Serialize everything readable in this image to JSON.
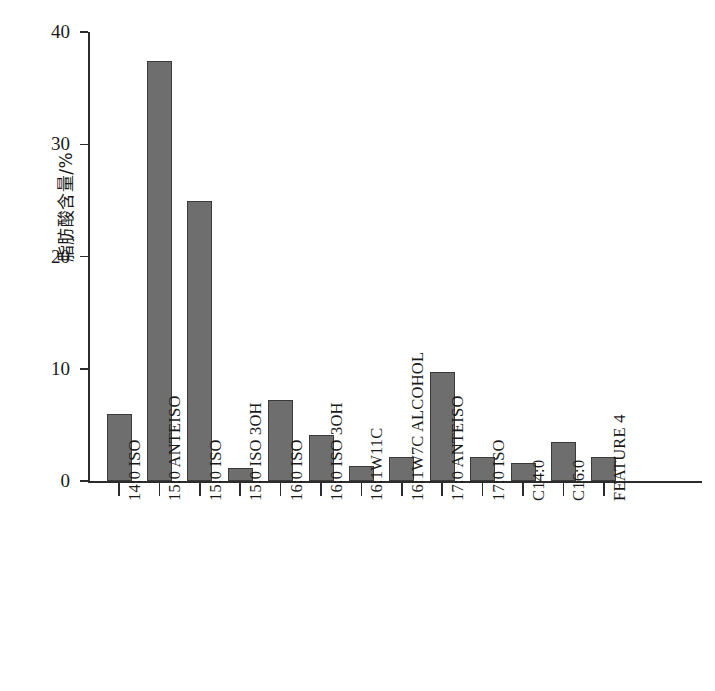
{
  "chart_data": {
    "type": "bar",
    "title": "",
    "subtitle": "",
    "xlabel": "",
    "ylabel": "脂肪酸含量/%",
    "ylim": [
      0,
      40
    ],
    "yticks": [
      0,
      10,
      20,
      30,
      40
    ],
    "ytick_labels": [
      "0",
      "10",
      "20",
      "30",
      "40"
    ],
    "grid": false,
    "legend": false,
    "legend_position": "none",
    "bar_color": "#6e6e6e",
    "bar_edge_color": "#3a3a3a",
    "axis_color": "#2b2b2b",
    "background_color": "#ffffff",
    "xtick_label_rotation": 90,
    "categories": [
      "14:0 ISO",
      "15:0 ANTEISO",
      "15:0 ISO",
      "15:0 ISO 3OH",
      "16:0 ISO",
      "16:0 ISO 3OH",
      "16:1W11C",
      "16:1W7C ALCOHOL",
      "17:0 ANTEISO",
      "17:0 ISO",
      "C14:0",
      "C16:0",
      "FEATURE 4"
    ],
    "values": [
      6.0,
      37.4,
      24.9,
      1.2,
      7.2,
      4.1,
      1.3,
      2.1,
      9.7,
      2.1,
      1.6,
      3.5,
      2.1
    ],
    "annotations": []
  },
  "axes": {
    "y_axis_name": "脂肪酸含量/%",
    "y_max_label": "40",
    "y_min_label": "0"
  }
}
